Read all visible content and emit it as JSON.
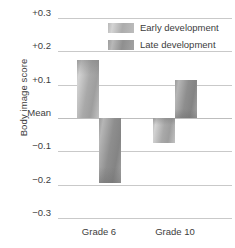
{
  "chart_data": {
    "type": "bar",
    "title": "",
    "xlabel": "",
    "ylabel": "Body image score",
    "categories": [
      "Grade 6",
      "Grade 10"
    ],
    "series": [
      {
        "name": "Early development",
        "values": [
          0.175,
          -0.075
        ]
      },
      {
        "name": "Late development",
        "values": [
          -0.195,
          0.115
        ]
      }
    ],
    "ylim": [
      -0.3,
      0.3
    ],
    "ytick_values": [
      0.3,
      0.2,
      0.1,
      0,
      -0.1,
      -0.2,
      -0.3
    ],
    "ytick_labels": [
      "+0.3",
      "+0.2",
      "+0.1",
      "Mean",
      "−0.1",
      "−0.2",
      "−0.3"
    ],
    "grid": true,
    "legend_position": "top-right",
    "baseline_label": "Mean",
    "colors": {
      "early": "#b4b4b4",
      "late": "#949494",
      "gridline": "#c9c9c9",
      "text": "#3d3d3d"
    }
  },
  "axes": {
    "y_title": "Body image score"
  },
  "legend": {
    "items": [
      {
        "label": "Early development",
        "swatch": "early"
      },
      {
        "label": "Late development",
        "swatch": "late"
      }
    ]
  }
}
